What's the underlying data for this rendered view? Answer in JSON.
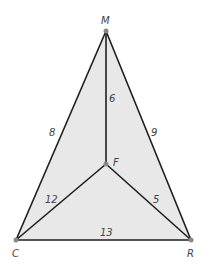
{
  "diagram": {
    "fill_color": "#e8e8e8",
    "line_color": "#1e1e1e",
    "point_color": "#888888",
    "points": {
      "M": {
        "label": "M",
        "x": 106,
        "y": 31
      },
      "F": {
        "label": "F",
        "x": 106,
        "y": 164
      },
      "C": {
        "label": "C",
        "x": 16,
        "y": 240
      },
      "R": {
        "label": "R",
        "x": 191,
        "y": 240
      }
    },
    "segments": [
      {
        "from": "M",
        "to": "C",
        "length": "8"
      },
      {
        "from": "M",
        "to": "R",
        "length": "9"
      },
      {
        "from": "M",
        "to": "F",
        "length": "6"
      },
      {
        "from": "C",
        "to": "F",
        "length": "12"
      },
      {
        "from": "F",
        "to": "R",
        "length": "5"
      },
      {
        "from": "C",
        "to": "R",
        "length": "13"
      }
    ]
  }
}
